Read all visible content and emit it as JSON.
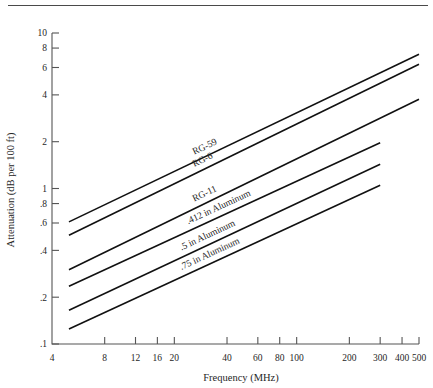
{
  "figure": {
    "divider": "horizontal-rule"
  },
  "chart_data": {
    "type": "line",
    "title": "",
    "xlabel": "Frequency (MHz)",
    "ylabel": "Attenuation (dB per 100 ft)",
    "xscale": "log",
    "yscale": "log",
    "xlim": [
      4,
      500
    ],
    "ylim": [
      0.1,
      10
    ],
    "grid": false,
    "legend_position": "inline-on-curve",
    "xticks": [
      8,
      12,
      16,
      20,
      40,
      60,
      80,
      100,
      200,
      300,
      400,
      500
    ],
    "xtick_labels": [
      "8",
      "12",
      "16",
      "20",
      "40",
      "60",
      "80",
      "100",
      "200",
      "300",
      "400",
      "500"
    ],
    "x_origin_label": "4",
    "yticks": [
      0.1,
      0.2,
      0.4,
      0.6,
      0.8,
      1,
      2,
      4,
      6,
      8,
      10
    ],
    "ytick_labels": [
      ".1",
      ".2",
      ".4",
      ".6",
      ".8",
      "1",
      "2",
      "4",
      "6",
      "8",
      "10"
    ],
    "series": [
      {
        "name": "RG-59",
        "label": "RG-59",
        "x": [
          5,
          500
        ],
        "y": [
          0.61,
          7.3
        ],
        "label_at_x": 26,
        "label_offset": -7
      },
      {
        "name": "RG-6",
        "label": "RG-6",
        "x": [
          5,
          500
        ],
        "y": [
          0.5,
          6.3
        ],
        "label_at_x": 26,
        "label_offset": -7
      },
      {
        "name": "RG-11",
        "label": "RG-11",
        "x": [
          5,
          500
        ],
        "y": [
          0.3,
          3.75
        ],
        "label_at_x": 26,
        "label_offset": -7
      },
      {
        "name": "412-in-aluminum",
        "label": ".412 in Aluminum",
        "x": [
          5,
          300
        ],
        "y": [
          0.235,
          1.97
        ],
        "label_at_x": 24,
        "label_offset": -7
      },
      {
        "name": "5-in-aluminum",
        "label": ".5 in Aluminum",
        "x": [
          5,
          300
        ],
        "y": [
          0.165,
          1.43
        ],
        "label_at_x": 22,
        "label_offset": -7
      },
      {
        "name": "75-in-aluminum",
        "label": ".75 in Aluminum",
        "x": [
          5,
          300
        ],
        "y": [
          0.125,
          1.05
        ],
        "label_at_x": 22,
        "label_offset": -7
      }
    ]
  }
}
